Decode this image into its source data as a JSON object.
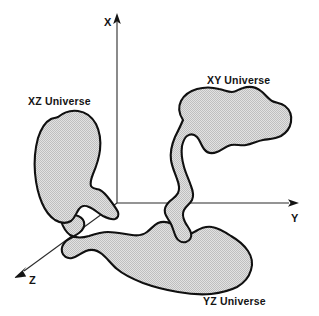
{
  "figure": {
    "background_color": "#ffffff",
    "blob_fill_color": "#d4d4d4",
    "blob_stroke_color": "#101010",
    "axis_color": "#2b2b2b",
    "label_color": "#141414"
  },
  "axes": {
    "origin": {
      "x": 117,
      "y": 203
    },
    "x_axis": {
      "label": "X",
      "label_pos": {
        "x": 104,
        "y": 26
      },
      "from": {
        "x": 117,
        "y": 203
      },
      "to": {
        "x": 117,
        "y": 16
      },
      "direction": "up"
    },
    "y_axis": {
      "label": "Y",
      "label_pos": {
        "x": 291,
        "y": 222
      },
      "from": {
        "x": 117,
        "y": 203
      },
      "to": {
        "x": 297,
        "y": 203
      },
      "direction": "right"
    },
    "z_axis": {
      "label": "Z",
      "label_pos": {
        "x": 29,
        "y": 284
      },
      "from": {
        "x": 117,
        "y": 203
      },
      "to": {
        "x": 16,
        "y": 277
      },
      "direction": "down-left"
    }
  },
  "regions": [
    {
      "id": "xz-universe",
      "label": "XZ Universe",
      "label_pos": {
        "x": 28,
        "y": 105
      },
      "plane": "XZ",
      "fill": "#d4d4d4"
    },
    {
      "id": "xy-universe",
      "label": "XY Universe",
      "label_pos": {
        "x": 207,
        "y": 84
      },
      "plane": "XY",
      "fill": "#d4d4d4"
    },
    {
      "id": "yz-universe",
      "label": "YZ Universe",
      "label_pos": {
        "x": 203,
        "y": 305
      },
      "plane": "YZ",
      "fill": "#d4d4d4"
    }
  ]
}
